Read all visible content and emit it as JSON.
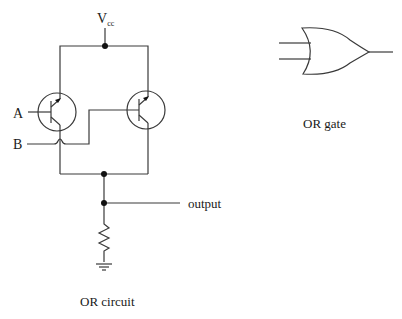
{
  "circuit": {
    "supply_label": "V",
    "supply_subscript": "cc",
    "input_a_label": "A",
    "input_b_label": "B",
    "output_label": "output",
    "caption": "OR circuit",
    "components": [
      "pnp-transistor-a",
      "pnp-transistor-b",
      "resistor",
      "ground"
    ]
  },
  "gate": {
    "caption": "OR gate",
    "type": "OR",
    "inputs": 2
  },
  "colors": {
    "wire": "#3a3a3a",
    "text": "#1a1a1a",
    "background": "#ffffff"
  }
}
